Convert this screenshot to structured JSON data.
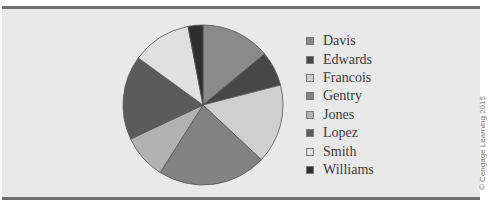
{
  "chart_data": {
    "type": "pie",
    "title": "",
    "categories": [
      "Davis",
      "Edwards",
      "Francois",
      "Gentry",
      "Jones",
      "Lopez",
      "Smith",
      "Williams"
    ],
    "values": [
      14,
      7,
      16,
      22,
      9,
      17,
      12,
      3
    ],
    "colors": [
      "#8a8a8a",
      "#474747",
      "#cfcfcf",
      "#828282",
      "#b2b2b2",
      "#5b5b5b",
      "#e0e0e0",
      "#2e2e2e"
    ],
    "start_angle_deg": 0,
    "direction": "clockwise",
    "legend_position": "right"
  },
  "legend": {
    "items": [
      {
        "label": "Davis",
        "color": "#8a8a8a"
      },
      {
        "label": "Edwards",
        "color": "#474747"
      },
      {
        "label": "Francois",
        "color": "#cfcfcf"
      },
      {
        "label": "Gentry",
        "color": "#828282"
      },
      {
        "label": "Jones",
        "color": "#b2b2b2"
      },
      {
        "label": "Lopez",
        "color": "#5b5b5b"
      },
      {
        "label": "Smith",
        "color": "#e0e0e0"
      },
      {
        "label": "Williams",
        "color": "#2e2e2e"
      }
    ]
  },
  "credit": "© Cengage Learning 2015"
}
